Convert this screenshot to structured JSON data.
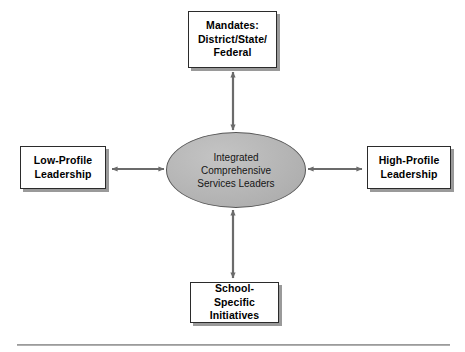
{
  "diagram": {
    "type": "hub-and-spoke",
    "colors": {
      "background": "#ffffff",
      "box_fill": "#ffffff",
      "box_border": "#2b2b2b",
      "box_shadow": "#9a9a9a",
      "ellipse_fill": "#b6b6b6",
      "ellipse_border": "#565656",
      "connector": "#6b6b6b",
      "text": "#000000",
      "rule": "#b0b0b0"
    },
    "center": {
      "shape": "ellipse",
      "label": "Integrated\nComprehensive\nServices Leaders"
    },
    "nodes": {
      "top": {
        "label": "Mandates:\nDistrict/State/\nFederal",
        "position": "top"
      },
      "left": {
        "label": "Low-Profile\nLeadership",
        "position": "left"
      },
      "right": {
        "label": "High-Profile\nLeadership",
        "position": "right"
      },
      "bottom": {
        "label": "School-Specific\nInitiatives",
        "position": "bottom"
      }
    },
    "connectors": [
      {
        "name": "top-connector",
        "from": "center",
        "to": "top",
        "style": "double-headed-arrow",
        "orientation": "vertical"
      },
      {
        "name": "left-connector",
        "from": "center",
        "to": "left",
        "style": "double-headed-arrow",
        "orientation": "horizontal"
      },
      {
        "name": "right-connector",
        "from": "center",
        "to": "right",
        "style": "double-headed-arrow",
        "orientation": "horizontal"
      },
      {
        "name": "bottom-connector",
        "from": "center",
        "to": "bottom",
        "style": "double-headed-arrow",
        "orientation": "vertical"
      }
    ]
  }
}
